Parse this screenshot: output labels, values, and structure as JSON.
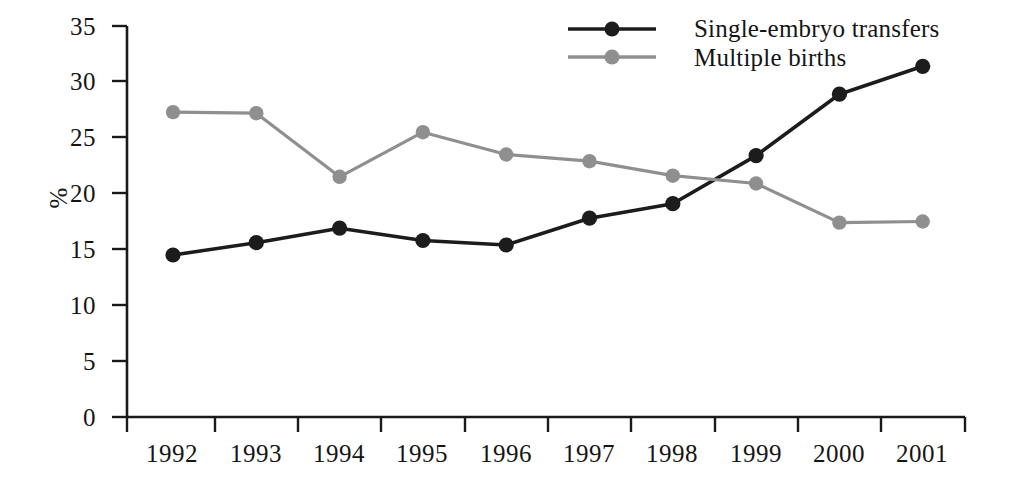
{
  "chart_data": {
    "type": "line",
    "title": "",
    "subtitle": "",
    "xlabel": "",
    "ylabel": "%",
    "categories": [
      "1992",
      "1993",
      "1994",
      "1995",
      "1996",
      "1997",
      "1998",
      "1999",
      "2000",
      "2001"
    ],
    "x": [
      1992,
      1993,
      1994,
      1995,
      1996,
      1997,
      1998,
      1999,
      2000,
      2001
    ],
    "ylim": [
      0,
      35
    ],
    "yticks": [
      0,
      5,
      10,
      15,
      20,
      25,
      30,
      35
    ],
    "ytick_labels": [
      "0",
      "5",
      "10",
      "15",
      "20",
      "25",
      "30",
      "35"
    ],
    "grid": false,
    "legend_position": "top-right",
    "series": [
      {
        "name": "Single-embryo transfers",
        "color": "#1c1c1c",
        "marker": "circle",
        "values": [
          14.5,
          15.6,
          16.9,
          15.8,
          15.4,
          17.8,
          19.1,
          23.4,
          28.9,
          31.4
        ]
      },
      {
        "name": "Multiple births",
        "color": "#8f8f8f",
        "marker": "circle",
        "values": [
          27.3,
          27.2,
          21.5,
          25.5,
          23.5,
          22.9,
          21.6,
          20.9,
          17.4,
          17.5
        ]
      }
    ]
  },
  "axis": {
    "y_title": "%"
  },
  "legend": {
    "items": [
      {
        "label": "Single-embryo transfers",
        "color": "#1c1c1c"
      },
      {
        "label": "Multiple births",
        "color": "#8f8f8f"
      }
    ]
  },
  "colors": {
    "series_dark": "#1c1c1c",
    "series_gray": "#8f8f8f",
    "axis": "#1a1a1a",
    "background": "#ffffff"
  }
}
